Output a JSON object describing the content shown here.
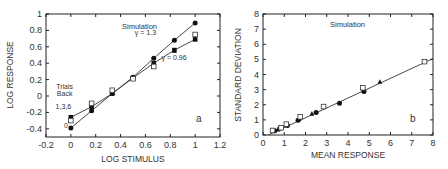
{
  "chart_data": [
    {
      "type": "line",
      "panel_label": "a",
      "title": "Simulation",
      "xlabel": "LOG STIMULUS",
      "ylabel": "LOG RESPONSE",
      "xlim": [
        -0.2,
        1.2
      ],
      "ylim": [
        -0.5,
        1.0
      ],
      "xticks": [
        "-0.2",
        "0",
        "0.2",
        "0.4",
        "0.6",
        "0.8",
        "1",
        "1.2"
      ],
      "yticks": [
        "-0.4",
        "-0.2",
        "0",
        "0.2",
        "0.4",
        "0.6",
        "0.8",
        "1"
      ],
      "annotations": [
        {
          "text": "γ = 1.3",
          "x": 0.6,
          "y": 0.74
        },
        {
          "text": "γ = 0.96",
          "x": 0.83,
          "y": 0.44
        },
        {
          "text": "Trials",
          "x": -0.05,
          "y": 0.08
        },
        {
          "text": "Back",
          "x": -0.05,
          "y": 0.0
        },
        {
          "text": "1,3,6",
          "x": -0.06,
          "y": -0.16
        },
        {
          "text": "0",
          "x": -0.04,
          "y": -0.39
        }
      ],
      "series": [
        {
          "name": "0 trials back (γ = 1.3)",
          "marker": "filled-circle",
          "line": true,
          "x": [
            0,
            0.167,
            0.333,
            0.5,
            0.667,
            0.833,
            1.0
          ],
          "y": [
            -0.39,
            -0.18,
            0.03,
            0.23,
            0.46,
            0.68,
            0.89
          ]
        },
        {
          "name": "1 trial back",
          "marker": "filled-square",
          "line": true,
          "x": [
            0,
            0.167,
            0.333,
            0.5,
            0.667,
            0.833,
            1.0
          ],
          "y": [
            -0.26,
            -0.13,
            0.03,
            0.22,
            0.4,
            0.56,
            0.69
          ]
        },
        {
          "name": "3 trials back",
          "marker": "filled-triangle",
          "line": false,
          "x": [
            0,
            0.167,
            0.333,
            0.5,
            0.667,
            0.833,
            1.0
          ],
          "y": [
            -0.26,
            -0.11,
            0.04,
            0.22,
            0.38,
            0.55,
            0.7
          ]
        },
        {
          "name": "6 trials back",
          "marker": "open-square",
          "line": false,
          "x": [
            0,
            0.167,
            0.333,
            0.5,
            0.667,
            1.0
          ],
          "y": [
            -0.3,
            -0.09,
            0.07,
            0.21,
            0.36,
            0.75
          ]
        }
      ]
    },
    {
      "type": "scatter",
      "panel_label": "b",
      "title": "Simulation",
      "xlabel": "MEAN RESPONSE",
      "ylabel": "STANDARD DEVIATION",
      "xlim": [
        0,
        8
      ],
      "ylim": [
        0,
        8
      ],
      "xticks": [
        "0",
        "1",
        "2",
        "3",
        "4",
        "5",
        "6",
        "7",
        "8"
      ],
      "yticks": [
        "0",
        "1",
        "2",
        "3",
        "4",
        "5",
        "6",
        "7",
        "8"
      ],
      "fit_line": {
        "x": [
          0.25,
          8.0
        ],
        "y": [
          0.0,
          5.05
        ]
      },
      "series": [
        {
          "name": "filled-circle",
          "marker": "filled-circle",
          "x": [
            0.55,
            0.8,
            1.15,
            1.65,
            2.5,
            3.6,
            4.75
          ],
          "y": [
            0.28,
            0.45,
            0.62,
            0.98,
            1.48,
            2.1,
            2.88
          ]
        },
        {
          "name": "filled-triangle",
          "marker": "filled-triangle",
          "x": [
            0.7,
            1.1,
            1.7,
            2.3,
            5.5
          ],
          "y": [
            0.35,
            0.65,
            1.05,
            1.4,
            3.5
          ]
        },
        {
          "name": "open-square",
          "marker": "open-square",
          "x": [
            0.45,
            0.85,
            1.1,
            1.75,
            2.85,
            4.7,
            7.6
          ],
          "y": [
            0.3,
            0.48,
            0.72,
            1.2,
            1.88,
            3.12,
            4.85
          ]
        }
      ]
    }
  ]
}
